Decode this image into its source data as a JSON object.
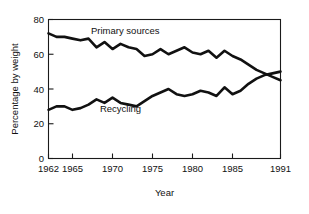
{
  "chart_data": {
    "type": "line",
    "title": "",
    "xlabel": "Year",
    "ylabel": "Percentage by weight",
    "xlim": [
      1962,
      1991
    ],
    "ylim": [
      0,
      80
    ],
    "grid": false,
    "legend_position": "inline-annotations",
    "xticks": [
      1962,
      1965,
      1970,
      1975,
      1980,
      1985,
      1991
    ],
    "xtick_labels": [
      "1962",
      "1965",
      "1970",
      "1975",
      "1980",
      "1985",
      "1991"
    ],
    "yticks": [
      0,
      20,
      40,
      60,
      80
    ],
    "ytick_labels": [
      "0",
      "20",
      "40",
      "60",
      "80"
    ],
    "x": [
      1962,
      1963,
      1964,
      1965,
      1966,
      1967,
      1968,
      1969,
      1970,
      1971,
      1972,
      1973,
      1974,
      1975,
      1976,
      1977,
      1978,
      1979,
      1980,
      1981,
      1982,
      1983,
      1984,
      1985,
      1986,
      1987,
      1988,
      1989,
      1990,
      1991
    ],
    "series": [
      {
        "name": "Primary sources",
        "label": "Primary sources",
        "color": "#111111",
        "values": [
          72,
          70,
          70,
          69,
          68,
          69,
          64,
          67,
          63,
          66,
          64,
          63,
          59,
          60,
          63,
          60,
          62,
          64,
          61,
          60,
          62,
          58,
          62,
          59,
          57,
          54,
          51,
          49,
          47,
          45
        ]
      },
      {
        "name": "Recycling",
        "label": "Recycling",
        "color": "#111111",
        "values": [
          28,
          30,
          30,
          28,
          29,
          31,
          34,
          32,
          35,
          32,
          31,
          30,
          33,
          36,
          38,
          40,
          37,
          36,
          37,
          39,
          38,
          36,
          41,
          37,
          39,
          43,
          46,
          48,
          49,
          50
        ]
      }
    ],
    "annotations": [
      {
        "name": "primary-sources-label",
        "text": "Primary sources",
        "x": 1971.6,
        "y": 71.5
      },
      {
        "name": "recycling-label",
        "text": "Recycling",
        "x": 1971.0,
        "y": 26.6
      }
    ]
  }
}
